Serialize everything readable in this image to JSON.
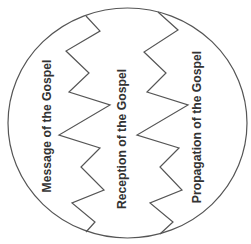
{
  "diagram": {
    "shape": "circle",
    "colors": {
      "stroke": "#555555",
      "text": "#333333",
      "background": "#ffffff"
    },
    "sections": [
      {
        "label": "Message of the Gospel"
      },
      {
        "label": "Reception of the Gospel"
      },
      {
        "label": "Propagation of the Gospel"
      }
    ],
    "dividers": [
      {
        "name": "zigzag-divider-left"
      },
      {
        "name": "zigzag-divider-right"
      }
    ]
  }
}
